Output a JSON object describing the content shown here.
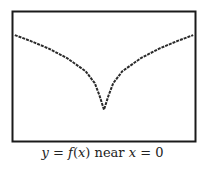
{
  "chart_data": {
    "type": "line",
    "title": "",
    "caption": "y = f(x) near x = 0",
    "caption_parts": {
      "lhs_var": "y",
      "eq1": " = ",
      "func": "f",
      "lparen": "(",
      "arg": "x",
      "rparen": ")",
      "word": " near ",
      "var2": "x",
      "eq2": " = ",
      "val": "0"
    },
    "xlabel": "",
    "ylabel": "",
    "xlim": [
      -1,
      1
    ],
    "ylim": [
      -1.5,
      1.2
    ],
    "grid": false,
    "axes_visible": false,
    "series": [
      {
        "name": "f(x)",
        "x": [
          -0.97,
          -0.8,
          -0.6,
          -0.4,
          -0.2,
          -0.1,
          -0.05,
          0,
          0.05,
          0.1,
          0.2,
          0.4,
          0.6,
          0.8,
          0.97
        ],
        "y": [
          0.7,
          0.58,
          0.42,
          0.22,
          -0.05,
          -0.3,
          -0.55,
          -0.85,
          -0.55,
          -0.3,
          -0.05,
          0.22,
          0.42,
          0.58,
          0.7
        ]
      }
    ],
    "colors": {
      "line": "#2a2a2a",
      "frame": "#1a1a1a",
      "background": "#ffffff"
    }
  }
}
